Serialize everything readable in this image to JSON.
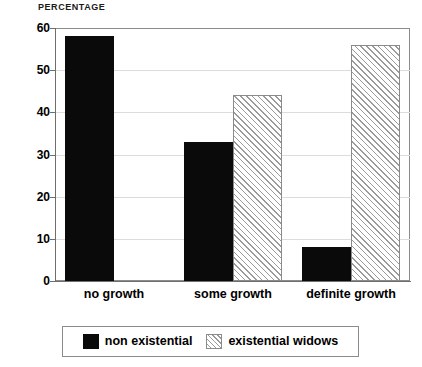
{
  "chart_data": {
    "type": "bar",
    "title": "PERCENTAGE",
    "xlabel": "",
    "ylabel": "",
    "ylim": [
      0,
      60
    ],
    "yticks": [
      0,
      10,
      20,
      30,
      40,
      50,
      60
    ],
    "ytick_labels": [
      "0",
      "10",
      "20",
      "30",
      "40",
      "50",
      "60"
    ],
    "grid": true,
    "grid_axis": "y",
    "legend_position": "below-center",
    "categories": [
      "no growth",
      "some growth",
      "definite growth"
    ],
    "series": [
      {
        "name": "non existential",
        "fill": "solid-black",
        "color": "#0a0a0a",
        "values": [
          58,
          33,
          8
        ]
      },
      {
        "name": "existential widows",
        "fill": "diagonal-hatch",
        "color": "#ffffff",
        "hatch_color": "#9a9a9a",
        "values": [
          0,
          44,
          56
        ]
      }
    ]
  },
  "axis": {
    "title": "PERCENTAGE",
    "y_ticks": [
      {
        "value": 60,
        "label": "60"
      },
      {
        "value": 50,
        "label": "50"
      },
      {
        "value": 40,
        "label": "40"
      },
      {
        "value": 30,
        "label": "30"
      },
      {
        "value": 20,
        "label": "20"
      },
      {
        "value": 10,
        "label": "10"
      },
      {
        "value": 0,
        "label": "0"
      }
    ],
    "x_labels": [
      "no growth",
      "some growth",
      "definite growth"
    ]
  },
  "legend": {
    "entries": [
      {
        "label": "non existential",
        "fill": "solid-black"
      },
      {
        "label": "existential widows",
        "fill": "diagonal-hatch"
      }
    ]
  },
  "colors": {
    "series_solid": "#0a0a0a",
    "series_hatch_line": "#9a9a9a",
    "frame": "#8c8c8c",
    "gridline": "#dcdcdc",
    "background": "#ffffff",
    "text": "#000000"
  }
}
